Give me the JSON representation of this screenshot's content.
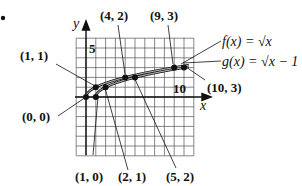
{
  "bullet": "•",
  "chart_data": {
    "type": "line",
    "title": "",
    "xlabel": "x",
    "ylabel": "y",
    "xlim": [
      -1,
      11
    ],
    "ylim": [
      -6,
      6
    ],
    "grid": true,
    "tick_labels": {
      "x": [
        "10"
      ],
      "y": [
        "5"
      ]
    },
    "series": [
      {
        "name": "f(x) = √x",
        "x": [
          0,
          1,
          4,
          9,
          10.5
        ],
        "y": [
          0,
          1,
          2,
          3,
          3.24
        ]
      },
      {
        "name": "g(x) = √x − 1",
        "x": [
          1,
          2,
          5,
          10,
          10.5
        ],
        "y": [
          0,
          1,
          2,
          3,
          3.08
        ]
      }
    ],
    "labeled_points": [
      {
        "label": "(1, 1)",
        "x": 1,
        "y": 1
      },
      {
        "label": "(4, 2)",
        "x": 4,
        "y": 2
      },
      {
        "label": "(9, 3)",
        "x": 9,
        "y": 3
      },
      {
        "label": "(10, 3)",
        "x": 10,
        "y": 3
      },
      {
        "label": "(0, 0)",
        "x": 0,
        "y": 0
      },
      {
        "label": "(1, 0)",
        "x": 1,
        "y": 0
      },
      {
        "label": "(2, 1)",
        "x": 2,
        "y": 1
      },
      {
        "label": "(5, 2)",
        "x": 5,
        "y": 2
      }
    ],
    "legend": [
      "f(x) = √x",
      "g(x) = √x − 1"
    ]
  },
  "labels": {
    "p11": "(1, 1)",
    "p42": "(4, 2)",
    "p93": "(9, 3)",
    "p103": "(10, 3)",
    "p00": "(0, 0)",
    "p10": "(1, 0)",
    "p21": "(2, 1)",
    "p52": "(5, 2)",
    "f_name": "f(x) = √x",
    "g_name": "g(x) = √x − 1",
    "x_axis": "x",
    "y_axis": "y",
    "tick_x": "10",
    "tick_y": "5"
  }
}
